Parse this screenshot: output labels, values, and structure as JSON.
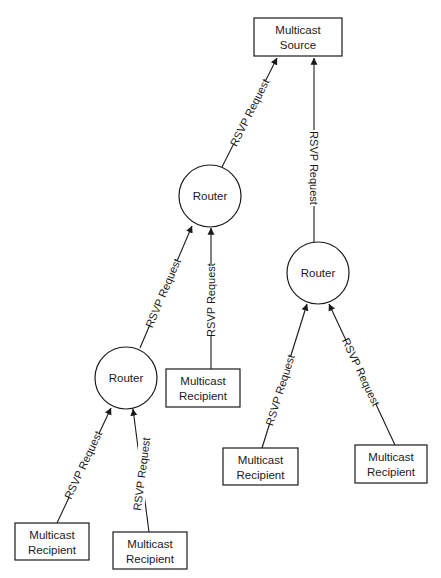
{
  "diagram": {
    "colors": {
      "stroke": "#1a1a1a",
      "background": "#ffffff"
    },
    "nodes": {
      "source": {
        "line1": "Multicast",
        "line2": "Source"
      },
      "router_top": {
        "label": "Router"
      },
      "router_right": {
        "label": "Router"
      },
      "router_left": {
        "label": "Router"
      },
      "recipient_mid": {
        "line1": "Multicast",
        "line2": "Recipient"
      },
      "recipient_bottom_left": {
        "line1": "Multicast",
        "line2": "Recipient"
      },
      "recipient_bottom_mid": {
        "line1": "Multicast",
        "line2": "Recipient"
      },
      "recipient_right_left": {
        "line1": "Multicast",
        "line2": "Recipient"
      },
      "recipient_right_right": {
        "line1": "Multicast",
        "line2": "Recipient"
      }
    },
    "edges": [
      {
        "from": "router_top",
        "to": "source",
        "label": "RSVP Request"
      },
      {
        "from": "router_right",
        "to": "source",
        "label": "RSVP Request"
      },
      {
        "from": "router_left",
        "to": "router_top",
        "label": "RSVP Request"
      },
      {
        "from": "recipient_mid",
        "to": "router_top",
        "label": "RSVP Request"
      },
      {
        "from": "recipient_bottom_left",
        "to": "router_left",
        "label": "RSVP Request"
      },
      {
        "from": "recipient_bottom_mid",
        "to": "router_left",
        "label": "RSVP Request"
      },
      {
        "from": "recipient_right_left",
        "to": "router_right",
        "label": "RSVP Request"
      },
      {
        "from": "recipient_right_right",
        "to": "router_right",
        "label": "RSVP Request"
      }
    ]
  }
}
